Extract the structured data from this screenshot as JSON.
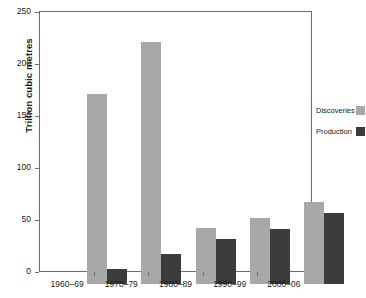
{
  "chart_data": {
    "type": "bar",
    "title": "",
    "xlabel": "",
    "ylabel": "Trillion cubic metres",
    "categories": [
      "1960–69",
      "1970–79",
      "1980–89",
      "1990–99",
      "2000–06"
    ],
    "series": [
      {
        "name": "Discoveries",
        "color": "#a8a8a8",
        "values": [
          183,
          233,
          54,
          63,
          79
        ]
      },
      {
        "name": "Production",
        "color": "#3c3c3c",
        "values": [
          14,
          29,
          43,
          53,
          68
        ]
      }
    ],
    "ylim": [
      0,
      250
    ],
    "yticks": [
      0,
      50,
      100,
      150,
      200,
      250
    ],
    "ytick_labels": [
      "0",
      "50",
      "100",
      "150",
      "200",
      "250"
    ],
    "grid": false,
    "legend_position": "right",
    "axis_color": "#6d6d6d",
    "background": "#ffffff"
  }
}
